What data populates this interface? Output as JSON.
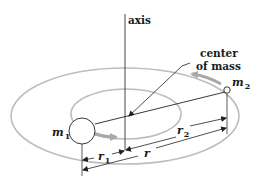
{
  "diagram": {
    "labels": {
      "axis": "axis",
      "center_of_mass_line1": "center",
      "center_of_mass_line2": "of mass",
      "m1": "m",
      "m1_sub": "1",
      "m2": "m",
      "m2_sub": "2",
      "r1": "r",
      "r1_sub": "1",
      "r2": "r",
      "r2_sub": "2",
      "r": "r"
    },
    "colors": {
      "orbit": "#bdbdbd",
      "motion_arrow": "#a8a8a8",
      "line": "#222222",
      "text": "#1a1a1a"
    }
  }
}
